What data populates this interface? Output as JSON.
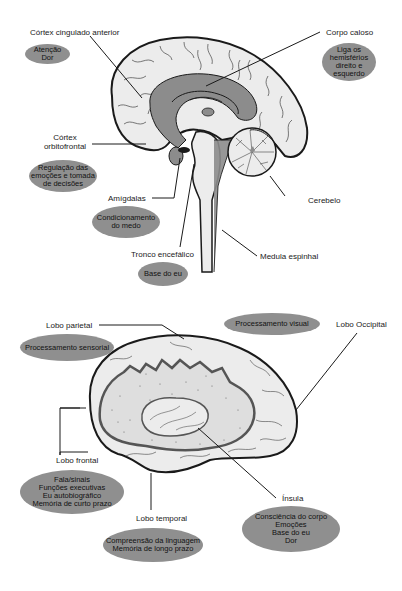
{
  "figure1": {
    "title": "Sagittal view of brain",
    "labels": {
      "acc": "Córtex cingulado anterior",
      "corpus": "Corpo caloso",
      "ofc_line1": "Córtex",
      "ofc_line2": "orbitofrontal",
      "amygdala": "Amígdalas",
      "brainstem": "Tronco encefálico",
      "cerebellum": "Cerebelo",
      "spinal": "Medula espinhal"
    },
    "functions": {
      "acc": [
        "Atenção",
        "Dor"
      ],
      "corpus": [
        "Liga os",
        "hemisférios",
        "direito e",
        "esquerdo"
      ],
      "ofc": [
        "Regulação das",
        "emoções e tomada",
        "de decisões"
      ],
      "amygdala": [
        "Condicionamento",
        "do medo"
      ],
      "brainstem": [
        "Base do eu"
      ]
    }
  },
  "figure2": {
    "title": "Lateral view of brain",
    "labels": {
      "parietal": "Lobo parietal",
      "occipital": "Lobo Occipital",
      "frontal": "Lobo frontal",
      "temporal": "Lobo temporal",
      "insula": "Ínsula"
    },
    "functions": {
      "parietal": [
        "Processamento sensorial"
      ],
      "occipital": [
        "Processamento visual"
      ],
      "frontal": [
        "Fala/sinais",
        "Funções executivas",
        "Eu autobiográfico",
        "Memória de curto prazo"
      ],
      "temporal": [
        "Compreensão da linguagem",
        "Memória de longo prazo"
      ],
      "insula": [
        "Consciência do corpo",
        "Emoções",
        "Base do eu",
        "Dor"
      ]
    }
  },
  "colors": {
    "ellipse_fill": "#8f8f8f",
    "brain_fill": "#ececec",
    "inner_fill": "#8c8c8c",
    "outline": "#1a1a1a"
  }
}
